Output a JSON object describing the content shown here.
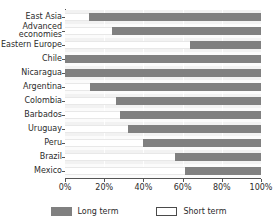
{
  "chart_data": {
    "type": "bar",
    "orientation": "horizontal",
    "stacked": true,
    "normalized_percent": true,
    "title": "",
    "subtitle": "",
    "xlabel": "",
    "ylabel": "",
    "xlim": [
      0,
      100
    ],
    "xticks": [
      0,
      20,
      40,
      60,
      80,
      100
    ],
    "xtick_labels": [
      "0%",
      "20%",
      "40%",
      "60%",
      "80%",
      "100%"
    ],
    "grid": true,
    "grid_axis": "x",
    "legend_position": "bottom-center",
    "categories": [
      "East Asia",
      "Advanced economies",
      "Eastern Europe",
      "Chile",
      "Nicaragua",
      "Argentina",
      "Colombia",
      "Barbados",
      "Uruguay",
      "Peru",
      "Brazil",
      "Mexico"
    ],
    "category_display": [
      "East Asia",
      "Advanced\neconomies",
      "Eastern Europe",
      "Chile",
      "Nicaragua",
      "Argentina",
      "Colombia",
      "Barbados",
      "Uruguay",
      "Peru",
      "Brazil",
      "Mexico"
    ],
    "series": [
      {
        "name": "Short term",
        "color": "#ffffff",
        "values": [
          12,
          24,
          64,
          0,
          0,
          13,
          26,
          28,
          32,
          40,
          56,
          61
        ]
      },
      {
        "name": "Long term",
        "color": "#808080",
        "values": [
          88,
          76,
          36,
          100,
          100,
          87,
          74,
          72,
          68,
          60,
          44,
          39
        ]
      }
    ]
  },
  "legend": {
    "entries": [
      {
        "label": "Long term",
        "swatch": "long-term-swatch"
      },
      {
        "label": "Short term",
        "swatch": "short-term-swatch"
      }
    ]
  },
  "colors": {
    "long_term": "#808080",
    "short_term": "#ffffff",
    "axis": "#555555",
    "text": "#2b2b2b",
    "background": "#ffffff"
  }
}
